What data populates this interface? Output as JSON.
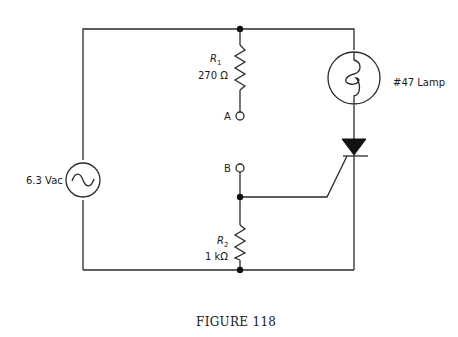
{
  "figure": {
    "caption": "FIGURE 118",
    "components": {
      "source": {
        "label": "6.3 Vac",
        "symbol": "ac-voltage-source"
      },
      "r1": {
        "name": "R",
        "sub": "1",
        "value": "270 Ω"
      },
      "r2": {
        "name": "R",
        "sub": "2",
        "value": "1 kΩ"
      },
      "lamp": {
        "label": "#47 Lamp"
      },
      "scr": {
        "symbol": "silicon-controlled-rectifier"
      },
      "terminal_a": {
        "label": "A"
      },
      "terminal_b": {
        "label": "B"
      }
    }
  }
}
